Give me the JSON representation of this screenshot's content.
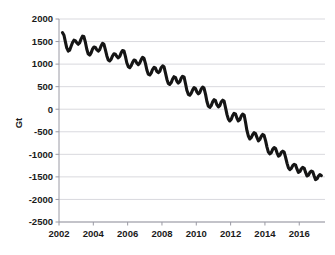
{
  "chart_data": {
    "type": "line",
    "title": "",
    "xlabel": "",
    "ylabel": "Gt",
    "xlim": [
      2002.0,
      2017.5
    ],
    "ylim": [
      -2500,
      2000
    ],
    "grid": true,
    "legend": null,
    "x_ticks": [
      "2002",
      "2004",
      "2006",
      "2008",
      "2010",
      "2012",
      "2014",
      "2016"
    ],
    "x_tick_values": [
      2002,
      2004,
      2006,
      2008,
      2010,
      2012,
      2014,
      2016
    ],
    "y_ticks": [
      "2000",
      "1500",
      "1000",
      "500",
      "0",
      "-500",
      "-1000",
      "-1500",
      "-2000",
      "-2500"
    ],
    "y_tick_values": [
      2000,
      1500,
      1000,
      500,
      0,
      -500,
      -1000,
      -1500,
      -2000,
      -2500
    ],
    "series": [
      {
        "name": "Cumulative mass anomaly",
        "color": "#151515",
        "x": [
          2002.2,
          2002.29,
          2002.37,
          2002.45,
          2002.54,
          2002.62,
          2002.7,
          2002.79,
          2002.87,
          2002.95,
          2003.04,
          2003.12,
          2003.2,
          2003.29,
          2003.37,
          2003.45,
          2003.54,
          2003.62,
          2003.7,
          2003.79,
          2003.87,
          2003.95,
          2004.04,
          2004.12,
          2004.2,
          2004.29,
          2004.37,
          2004.45,
          2004.54,
          2004.62,
          2004.7,
          2004.79,
          2004.87,
          2004.95,
          2005.04,
          2005.12,
          2005.2,
          2005.29,
          2005.37,
          2005.45,
          2005.54,
          2005.62,
          2005.7,
          2005.79,
          2005.87,
          2005.95,
          2006.04,
          2006.12,
          2006.2,
          2006.29,
          2006.37,
          2006.45,
          2006.54,
          2006.62,
          2006.7,
          2006.79,
          2006.87,
          2006.95,
          2007.04,
          2007.12,
          2007.2,
          2007.29,
          2007.37,
          2007.45,
          2007.54,
          2007.62,
          2007.7,
          2007.79,
          2007.87,
          2007.95,
          2008.04,
          2008.12,
          2008.2,
          2008.29,
          2008.37,
          2008.45,
          2008.54,
          2008.62,
          2008.7,
          2008.79,
          2008.87,
          2008.95,
          2009.04,
          2009.12,
          2009.2,
          2009.29,
          2009.37,
          2009.45,
          2009.54,
          2009.62,
          2009.7,
          2009.79,
          2009.87,
          2009.95,
          2010.04,
          2010.12,
          2010.2,
          2010.29,
          2010.37,
          2010.45,
          2010.54,
          2010.62,
          2010.7,
          2010.79,
          2010.87,
          2010.95,
          2011.04,
          2011.12,
          2011.2,
          2011.29,
          2011.37,
          2011.45,
          2011.54,
          2011.62,
          2011.7,
          2011.79,
          2011.87,
          2011.95,
          2012.04,
          2012.12,
          2012.2,
          2012.29,
          2012.37,
          2012.45,
          2012.54,
          2012.62,
          2012.7,
          2012.79,
          2012.87,
          2012.95,
          2013.04,
          2013.12,
          2013.2,
          2013.29,
          2013.37,
          2013.45,
          2013.54,
          2013.62,
          2013.7,
          2013.79,
          2013.87,
          2013.95,
          2014.04,
          2014.12,
          2014.2,
          2014.29,
          2014.37,
          2014.45,
          2014.54,
          2014.62,
          2014.7,
          2014.79,
          2014.87,
          2014.95,
          2015.04,
          2015.12,
          2015.2,
          2015.29,
          2015.37,
          2015.45,
          2015.54,
          2015.62,
          2015.7,
          2015.79,
          2015.87,
          2015.95,
          2016.04,
          2016.12,
          2016.2,
          2016.29,
          2016.37,
          2016.45,
          2016.54,
          2016.62,
          2016.7,
          2016.79,
          2016.87,
          2016.95,
          2017.04,
          2017.12,
          2017.2,
          2017.29
        ],
        "y": [
          1700,
          1640,
          1500,
          1360,
          1290,
          1310,
          1390,
          1480,
          1530,
          1520,
          1470,
          1440,
          1470,
          1560,
          1620,
          1610,
          1480,
          1330,
          1230,
          1200,
          1250,
          1330,
          1380,
          1370,
          1320,
          1290,
          1320,
          1400,
          1460,
          1440,
          1320,
          1180,
          1090,
          1070,
          1110,
          1180,
          1230,
          1220,
          1170,
          1140,
          1170,
          1250,
          1300,
          1290,
          1170,
          1030,
          940,
          920,
          960,
          1040,
          1090,
          1080,
          1020,
          990,
          1020,
          1100,
          1150,
          1130,
          1010,
          870,
          780,
          760,
          800,
          880,
          930,
          910,
          840,
          810,
          840,
          920,
          960,
          940,
          810,
          660,
          570,
          550,
          590,
          670,
          720,
          700,
          620,
          580,
          610,
          690,
          730,
          710,
          570,
          420,
          330,
          310,
          350,
          430,
          480,
          460,
          380,
          340,
          370,
          450,
          490,
          470,
          330,
          170,
          70,
          40,
          80,
          160,
          210,
          190,
          100,
          50,
          80,
          160,
          200,
          180,
          40,
          -120,
          -220,
          -260,
          -220,
          -140,
          -90,
          -110,
          -200,
          -260,
          -230,
          -150,
          -110,
          -130,
          -290,
          -470,
          -600,
          -660,
          -630,
          -560,
          -520,
          -540,
          -630,
          -700,
          -670,
          -600,
          -560,
          -580,
          -700,
          -840,
          -950,
          -990,
          -960,
          -890,
          -850,
          -870,
          -960,
          -1040,
          -1020,
          -960,
          -930,
          -950,
          -1060,
          -1200,
          -1300,
          -1340,
          -1310,
          -1250,
          -1220,
          -1240,
          -1330,
          -1400,
          -1380,
          -1320,
          -1290,
          -1310,
          -1400,
          -1480,
          -1460,
          -1400,
          -1370,
          -1390,
          -1480,
          -1560,
          -1540,
          -1480,
          -1450,
          -1470
        ],
        "start_value": 1700,
        "end_value": -1910,
        "units": "Gt"
      }
    ],
    "annotations": []
  }
}
